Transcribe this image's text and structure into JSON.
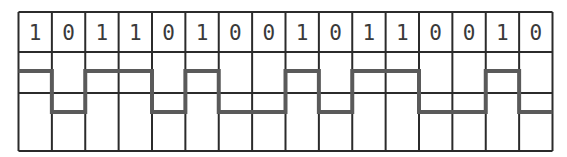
{
  "diagram": {
    "type": "digital-waveform",
    "bits": [
      "1",
      "0",
      "1",
      "1",
      "0",
      "1",
      "0",
      "0",
      "1",
      "0",
      "1",
      "1",
      "0",
      "0",
      "1",
      "0"
    ],
    "colors": {
      "grid": "#2b2b2b",
      "signal": "#5a5a5a",
      "text": "#3a3a3a",
      "background": "#ffffff"
    }
  }
}
